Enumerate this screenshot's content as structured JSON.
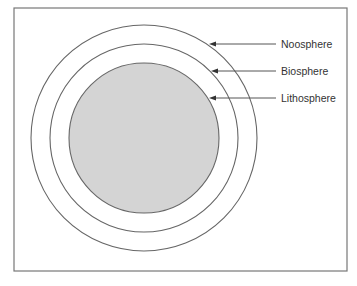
{
  "diagram": {
    "type": "concentric-spheres",
    "frame": {
      "x": 14,
      "y": 8,
      "width": 333,
      "height": 263,
      "stroke": "#777777"
    },
    "center": {
      "x": 144,
      "y": 138
    },
    "circles": [
      {
        "name": "Noosphere",
        "radius": 113,
        "fill": "none",
        "stroke": "#666666"
      },
      {
        "name": "Biosphere",
        "radius": 94,
        "fill": "none",
        "stroke": "#666666"
      },
      {
        "name": "Lithosphere",
        "radius": 75,
        "fill": "#d4d4d4",
        "stroke": "#666666"
      }
    ],
    "labels": [
      {
        "text": "Noosphere",
        "x": 281,
        "y": 48,
        "arrow_from_x": 276,
        "arrow_to_x": 209,
        "arrow_y": 44
      },
      {
        "text": "Biosphere",
        "x": 281,
        "y": 75,
        "arrow_from_x": 276,
        "arrow_to_x": 211,
        "arrow_y": 71
      },
      {
        "text": "Lithosphere",
        "x": 281,
        "y": 102,
        "arrow_from_x": 276,
        "arrow_to_x": 209,
        "arrow_y": 98
      }
    ],
    "arrow_color": "#555555"
  }
}
